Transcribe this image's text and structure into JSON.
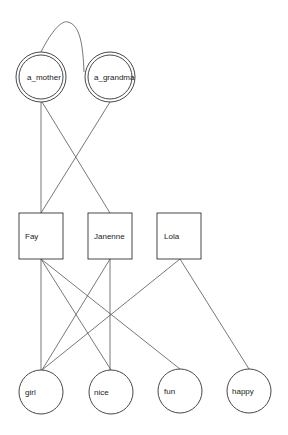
{
  "diagram": {
    "type": "graph",
    "nodes": [
      {
        "id": "a_mother",
        "label": "a_mother",
        "shape": "double-circle"
      },
      {
        "id": "a_grandma",
        "label": "a_grandma",
        "shape": "double-circle"
      },
      {
        "id": "Fay",
        "label": "Fay",
        "shape": "square"
      },
      {
        "id": "Janenne",
        "label": "Janenne",
        "shape": "square"
      },
      {
        "id": "Lola",
        "label": "Lola",
        "shape": "square"
      },
      {
        "id": "girl",
        "label": "girl",
        "shape": "circle"
      },
      {
        "id": "nice",
        "label": "nice",
        "shape": "circle"
      },
      {
        "id": "fun",
        "label": "fun",
        "shape": "circle"
      },
      {
        "id": "happy",
        "label": "happy",
        "shape": "circle"
      }
    ],
    "edges": [
      {
        "from": "a_mother",
        "to": "a_grandma",
        "style": "curve"
      },
      {
        "from": "a_mother",
        "to": "Fay"
      },
      {
        "from": "a_mother",
        "to": "Janenne"
      },
      {
        "from": "a_grandma",
        "to": "Fay"
      },
      {
        "from": "Fay",
        "to": "girl"
      },
      {
        "from": "Fay",
        "to": "nice"
      },
      {
        "from": "Fay",
        "to": "fun"
      },
      {
        "from": "Janenne",
        "to": "girl"
      },
      {
        "from": "Janenne",
        "to": "nice"
      },
      {
        "from": "Lola",
        "to": "girl"
      },
      {
        "from": "Lola",
        "to": "happy"
      }
    ]
  }
}
